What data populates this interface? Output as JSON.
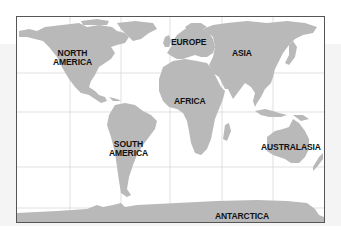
{
  "map": {
    "title": "World continents map",
    "land_color": "#b9b9b9",
    "ocean_color": "#ffffff",
    "grid_color": "#cfcfcf",
    "frame_color": "#555555",
    "labels": {
      "north_america": "NORTH\nAMERICA",
      "europe": "EUROPE",
      "asia": "ASIA",
      "africa": "AFRICA",
      "south_america": "SOUTH\nAMERICA",
      "australasia": "AUSTRALASIA",
      "antarctica": "ANTARCTICA"
    }
  }
}
